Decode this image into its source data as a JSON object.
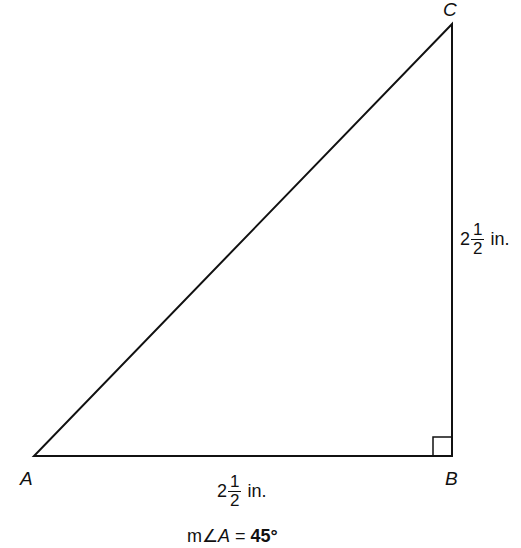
{
  "diagram": {
    "type": "right-triangle",
    "vertices": [
      {
        "id": "A",
        "label": "A"
      },
      {
        "id": "B",
        "label": "B"
      },
      {
        "id": "C",
        "label": "C"
      }
    ],
    "right_angle_at": "B",
    "sides": {
      "AB": {
        "whole": "2",
        "numerator": "1",
        "denominator": "2",
        "unit": "in."
      },
      "BC": {
        "whole": "2",
        "numerator": "1",
        "denominator": "2",
        "unit": "in."
      }
    },
    "angle_annotation": {
      "prefix": "m∠",
      "vertex": "A",
      "equals": " = ",
      "value": "45°"
    },
    "colors": {
      "stroke": "#111111",
      "background": "#ffffff"
    }
  }
}
